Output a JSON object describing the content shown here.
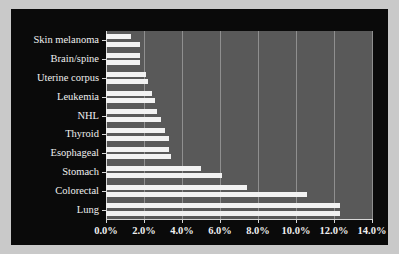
{
  "chart_data": {
    "type": "bar",
    "orientation": "horizontal",
    "title": "",
    "subtitle": "",
    "xlabel": "",
    "ylabel": "",
    "xlim": [
      0,
      14
    ],
    "xtick_labels": [
      "0.0%",
      "2.0%",
      "4.0%",
      "6.0%",
      "8.0%",
      "10.0%",
      "12.0%",
      "14.0%"
    ],
    "xtick_values": [
      0,
      2,
      4,
      6,
      8,
      10,
      12,
      14
    ],
    "grid": true,
    "grid_axis": "x",
    "legend": null,
    "legend_position": "none",
    "categories": [
      "Skin melanoma",
      "Brain/spine",
      "Uterine corpus",
      "Leukemia",
      "NHL",
      "Thyroid",
      "Esophageal",
      "Stomach",
      "Colorectal",
      "Lung"
    ],
    "series": [
      {
        "name": "Series 1",
        "values": [
          1.3,
          1.8,
          2.1,
          2.4,
          2.7,
          3.1,
          3.3,
          5.0,
          7.4,
          12.3
        ]
      },
      {
        "name": "Series 2",
        "values": [
          1.8,
          1.8,
          2.2,
          2.6,
          2.9,
          3.3,
          3.4,
          6.1,
          10.6,
          12.3
        ]
      }
    ],
    "colors": {
      "bar": "#f2f2f2",
      "plot_background": "#595959",
      "figure_background": "#0a0a0a",
      "outer_margin": "#c9c9c9",
      "gridline": "#8f8f8f",
      "axis": "#d8d8d8",
      "text": "#efefef"
    }
  }
}
